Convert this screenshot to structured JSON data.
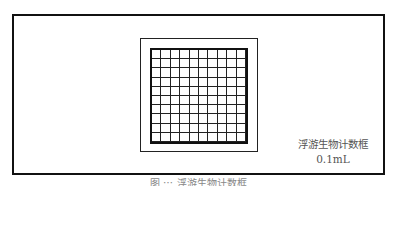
{
  "diagram": {
    "grid": {
      "rows": 10,
      "cols": 10
    },
    "label_line1": "浮游生物计数框",
    "label_line2": "0.1mL",
    "caption": "图 ⋯ 浮游生物计数框"
  }
}
